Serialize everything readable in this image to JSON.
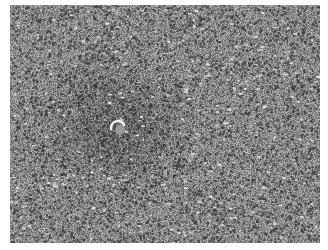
{
  "image": {
    "kind": "grayscale histology micrograph",
    "description": "H&E-style tissue section, dense cellular field with darker circular cluster (lymphoid follicle-like) centered left with small central lumen",
    "width": 310,
    "height": 238,
    "offset": {
      "x": 10,
      "y": 5
    },
    "colors": {
      "background": "#ffffff",
      "tissue_mid": "#8c8c8c",
      "nuclei_dark": "#3a3a3a",
      "highlight": "#e6e6e6"
    },
    "dark_region": {
      "cx": 105,
      "cy": 120,
      "r": 80
    },
    "lumen": {
      "cx": 108,
      "cy": 123,
      "r": 7
    },
    "seed": 7
  }
}
